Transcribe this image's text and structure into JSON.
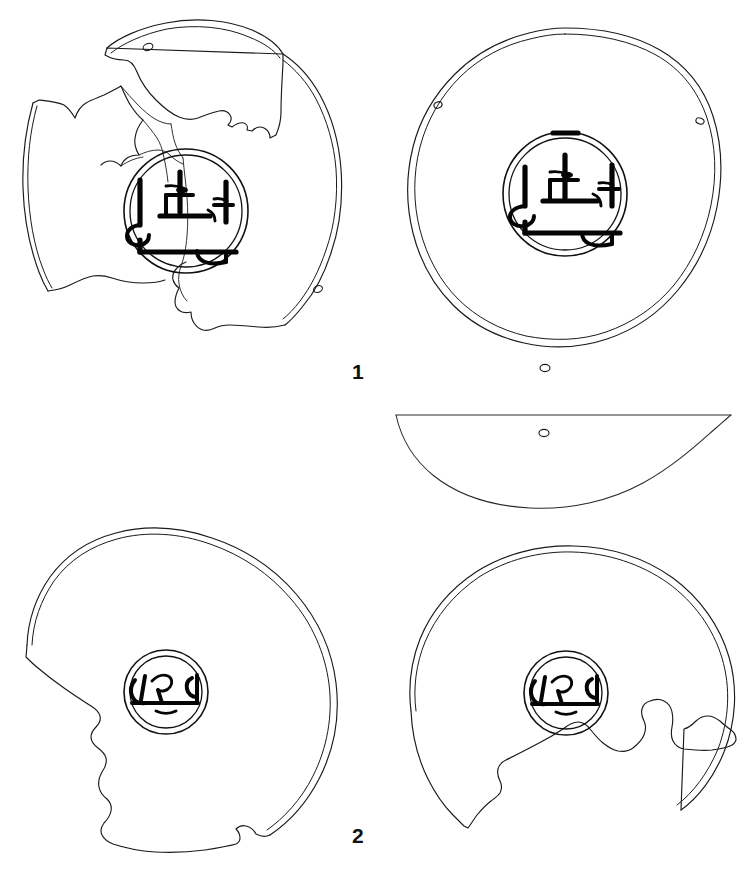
{
  "plate": {
    "title": "Line drawings of two inscribed discs",
    "background_color": "#ffffff",
    "ink_color": "#111111",
    "width": 750,
    "height": 873
  },
  "figures": [
    {
      "id": "figure-1",
      "label": "1",
      "label_x": 352,
      "label_y": 379,
      "views": [
        {
          "id": "fig1-obverse",
          "name": "fragmented-disc-obverse",
          "state": "fragmented",
          "fragment_count": 6,
          "perforations": 2,
          "medallion": {
            "cx": 186,
            "cy": 211,
            "r_outer": 62,
            "r_inner": 57
          },
          "inscription_id": "inscription-a"
        },
        {
          "id": "fig1-reverse",
          "name": "complete-disc-reverse",
          "state": "complete",
          "fragment_count": 0,
          "perforations": 3,
          "medallion": {
            "cx": 565,
            "cy": 194,
            "r_outer": 62,
            "r_inner": 56
          },
          "inscription_id": "inscription-a"
        },
        {
          "id": "fig1-profile",
          "name": "disc-profile-section",
          "state": "section",
          "perforations": 1
        }
      ]
    },
    {
      "id": "figure-2",
      "label": "2",
      "label_x": 352,
      "label_y": 843,
      "views": [
        {
          "id": "fig2-obverse",
          "name": "broken-disc-obverse",
          "state": "broken",
          "perforations": 0,
          "medallion": {
            "cx": 166,
            "cy": 692,
            "r_outer": 42,
            "r_inner": 36
          },
          "inscription_id": "inscription-b"
        },
        {
          "id": "fig2-reverse",
          "name": "broken-disc-reverse",
          "state": "broken",
          "perforations": 0,
          "medallion": {
            "cx": 566,
            "cy": 693,
            "r_outer": 42,
            "r_inner": 36
          },
          "inscription_id": "inscription-b"
        }
      ]
    }
  ],
  "inscriptions": [
    {
      "id": "inscription-a",
      "name": "central-medallion-inscription-figure-1",
      "script": "arabic-kufic-stamp",
      "stroke_color": "#050505",
      "description": "dense angular stamped legend across medallion"
    },
    {
      "id": "inscription-b",
      "name": "central-medallion-inscription-figure-2",
      "script": "arabic-cursive-stamp",
      "stroke_color": "#050505",
      "description": "single horizontal line legend with loop above"
    }
  ]
}
